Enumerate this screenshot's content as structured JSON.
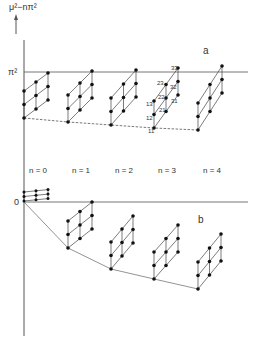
{
  "figure": {
    "y_axis_label": "μ²−nπ²",
    "y_axis_arrow": "up-arrow",
    "tick_pi_squared": "π²",
    "tick_zero": "0",
    "panel_a_label": "a",
    "panel_b_label": "b",
    "n_labels": [
      "n = 0",
      "n = 1",
      "n = 2",
      "n = 3",
      "n = 4"
    ],
    "point_labels_n3": [
      "11",
      "12",
      "13",
      "21",
      "22",
      "23",
      "31",
      "32",
      "33"
    ],
    "panel_a": {
      "description": "3×3 skewed lattices of levels for n = 0..4, top-right corner at π², dashed envelope through bottom corners",
      "envelope_style": "dashed"
    },
    "panel_b": {
      "description": "3×3 skewed lattices of levels for n = 0..4, top-right corner at 0, solid envelope through bottom corners",
      "envelope_style": "solid"
    }
  }
}
